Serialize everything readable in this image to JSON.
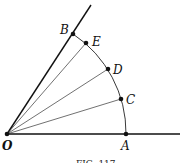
{
  "figure": {
    "points": {
      "O": {
        "label": "O",
        "x": 7,
        "y": 134
      },
      "A": {
        "label": "A",
        "x": 126,
        "y": 134
      },
      "B": {
        "label": "B",
        "x": 73,
        "y": 34
      },
      "C": {
        "label": "C",
        "x": 121,
        "y": 99
      },
      "D": {
        "label": "D",
        "x": 108,
        "y": 69
      },
      "E": {
        "label": "E",
        "x": 86,
        "y": 43
      }
    },
    "caption": "FIG. 117",
    "stroke_color": "#111111"
  }
}
